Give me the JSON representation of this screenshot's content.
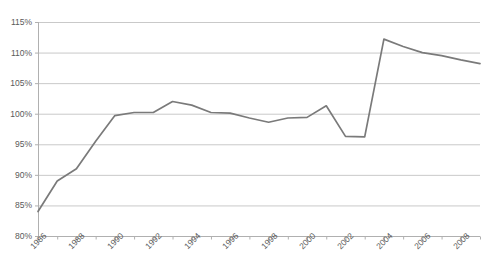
{
  "chart_data": {
    "type": "line",
    "title": "",
    "subtitle": "",
    "xlabel": "",
    "ylabel": "",
    "grid": true,
    "legend": false,
    "legend_position": "none",
    "ylim": [
      80,
      115
    ],
    "xlim": [
      1986,
      2009
    ],
    "ytick_labels": [
      "115%",
      "110%",
      "105%",
      "100%",
      "95%",
      "90%",
      "85%",
      "80%"
    ],
    "ytick_values": [
      115,
      110,
      105,
      100,
      95,
      90,
      85,
      80
    ],
    "xtick_labels": [
      "1986",
      "1988",
      "1990",
      "1992",
      "1994",
      "1996",
      "1998",
      "2000",
      "2002",
      "2004",
      "2006",
      "2008"
    ],
    "xtick_values": [
      1986,
      1988,
      1990,
      1992,
      1994,
      1996,
      1998,
      2000,
      2002,
      2004,
      2006,
      2008
    ],
    "minor_xtick_values": [
      1987,
      1989,
      1991,
      1993,
      1995,
      1997,
      1999,
      2001,
      2003,
      2005,
      2007,
      2009
    ],
    "x": [
      1986,
      1987,
      1988,
      1989,
      1990,
      1991,
      1992,
      1993,
      1994,
      1995,
      1996,
      1997,
      1998,
      1999,
      2000,
      2001,
      2002,
      2003,
      2004,
      2005,
      2006,
      2007,
      2008,
      2009
    ],
    "values": [
      84.0,
      89.0,
      91.0,
      95.5,
      99.7,
      100.2,
      100.2,
      102.0,
      101.4,
      100.2,
      100.1,
      99.3,
      98.6,
      99.3,
      99.4,
      101.3,
      96.3,
      96.2,
      112.2,
      111.0,
      110.0,
      109.5,
      108.8,
      108.2
    ],
    "series": [
      {
        "name": "series-1",
        "color": "#7a7a7a",
        "values": [
          84.0,
          89.0,
          91.0,
          95.5,
          99.7,
          100.2,
          100.2,
          102.0,
          101.4,
          100.2,
          100.1,
          99.3,
          98.6,
          99.3,
          99.4,
          101.3,
          96.3,
          96.2,
          112.2,
          111.0,
          110.0,
          109.5,
          108.8,
          108.2
        ]
      }
    ]
  },
  "style": {
    "grid_color": "#c9c9c9",
    "axis_color": "#b0b0b0",
    "line_color": "#7a7a7a",
    "tick_text_color": "#5a5a5a",
    "background": "#ffffff"
  }
}
